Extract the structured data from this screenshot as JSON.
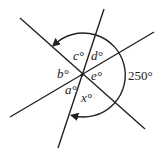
{
  "diagram": {
    "angles": {
      "a": "a°",
      "b": "b°",
      "c": "c°",
      "d": "d°",
      "e": "e°",
      "x": "x°"
    },
    "arc_label": "250°",
    "colors": {
      "stroke": "#222222",
      "background": "#ffffff"
    }
  }
}
